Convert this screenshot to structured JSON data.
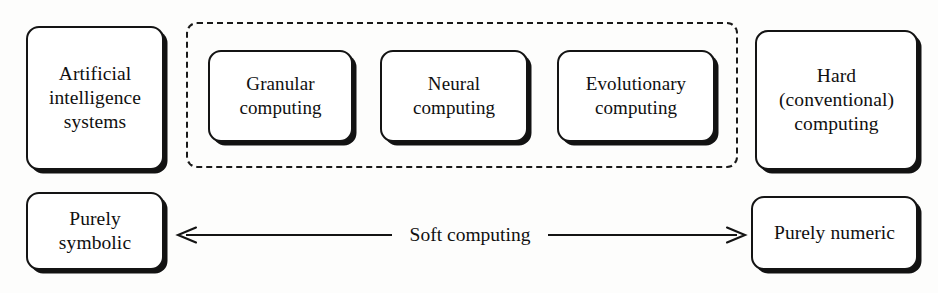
{
  "diagram": {
    "background_color": "#fdfdfc",
    "stroke_color": "#141414",
    "nodes": {
      "ai_systems": {
        "label": "Artificial\nintelligence\nsystems"
      },
      "granular": {
        "label": "Granular\ncomputing"
      },
      "neural": {
        "label": "Neural\ncomputing"
      },
      "evolutionary": {
        "label": "Evolutionary\ncomputing"
      },
      "hard_computing": {
        "label": "Hard\n(conventional)\ncomputing"
      },
      "purely_symbolic": {
        "label": "Purely\nsymbolic"
      },
      "purely_numeric": {
        "label": "Purely numeric"
      }
    },
    "group": {
      "name": "soft-computing-group",
      "border_style": "dashed"
    },
    "axis": {
      "label": "Soft computing",
      "left_endpoint": "Purely symbolic",
      "right_endpoint": "Purely numeric",
      "arrow_style": "double-headed"
    }
  }
}
